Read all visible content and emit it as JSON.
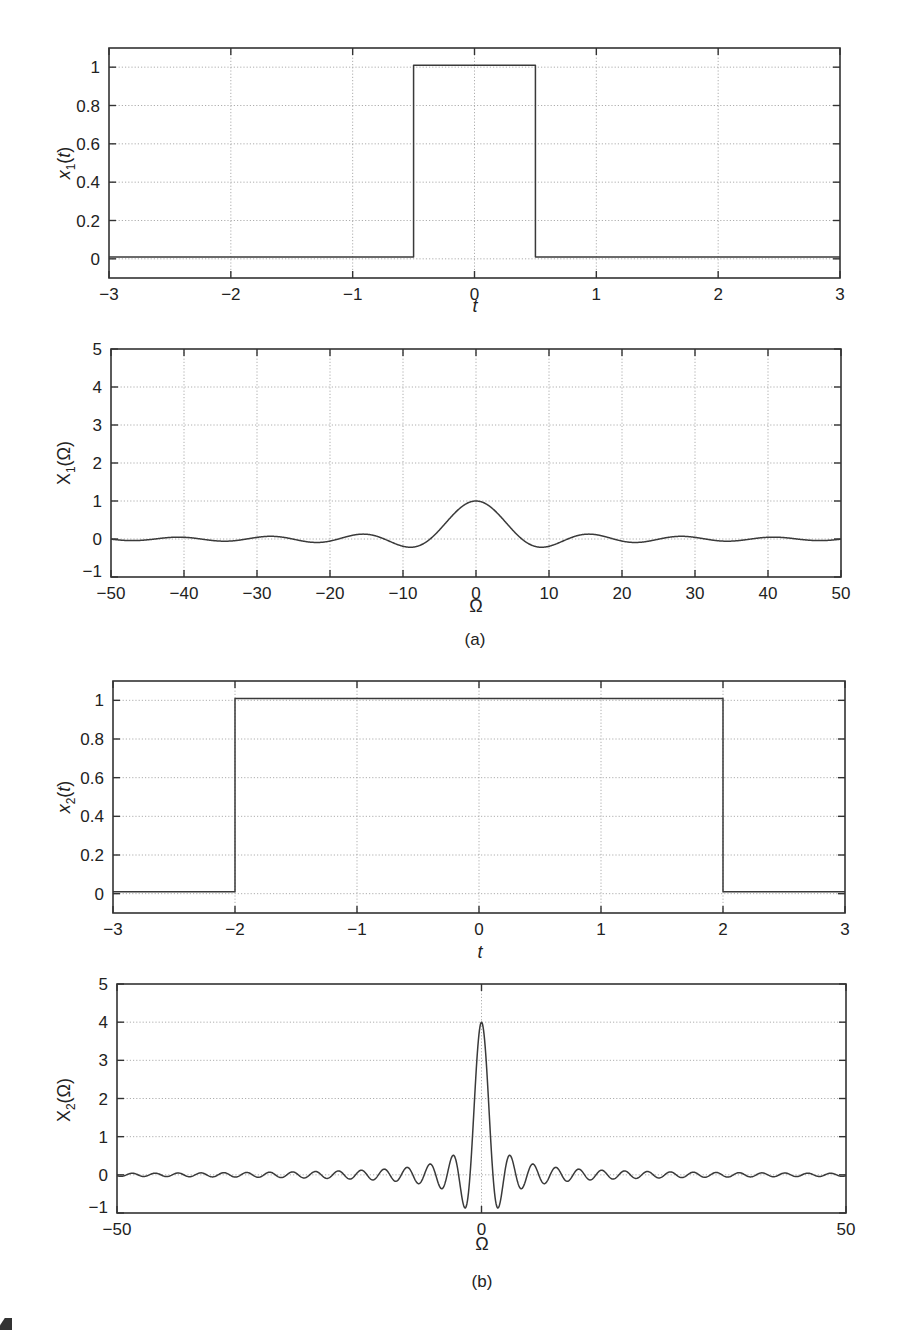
{
  "figure": {
    "captions": [
      "(a)",
      "(b)"
    ],
    "corner_fragment": "1"
  },
  "chart_data": [
    {
      "id": "x1_time",
      "type": "line",
      "title": "",
      "xlabel": "t",
      "ylabel": "x1(t)",
      "ylabel_main": "x",
      "ylabel_sub": "1",
      "ylabel_arg": "(t)",
      "xlim": [
        -3,
        3
      ],
      "ylim": [
        -0.1,
        1.1
      ],
      "xticks": [
        -3,
        -2,
        -1,
        0,
        1,
        2,
        3
      ],
      "xtick_labels": [
        "−3",
        "−2",
        "−1",
        "0",
        "1",
        "2",
        "3"
      ],
      "yticks": [
        0,
        0.2,
        0.4,
        0.6,
        0.8,
        1
      ],
      "ytick_labels": [
        "0",
        "0.2",
        "0.4",
        "0.6",
        "0.8",
        "1"
      ],
      "grid": true,
      "vgrid": [
        -2,
        -1,
        0,
        1,
        2
      ],
      "hgrid": [
        0,
        0.2,
        0.4,
        0.6,
        0.8,
        1
      ],
      "frame": {
        "left": 109,
        "right": 840,
        "top": 48,
        "bottom": 278
      },
      "x": [
        -3,
        -0.5,
        -0.5,
        0.5,
        0.5,
        3
      ],
      "y": [
        0,
        0,
        1,
        1,
        0,
        0
      ],
      "xlabel_pos": {
        "x": 475,
        "y": 312
      },
      "ylabel_pos": {
        "x": 70,
        "y": 163
      }
    },
    {
      "id": "X1_freq",
      "type": "line",
      "title": "",
      "xlabel": "Ω",
      "ylabel": "X1(Ω)",
      "ylabel_main": "X",
      "ylabel_sub": "1",
      "ylabel_arg": "(Ω)",
      "xlim": [
        -50,
        50
      ],
      "ylim": [
        -1,
        5
      ],
      "xticks": [
        -50,
        -40,
        -30,
        -20,
        -10,
        0,
        10,
        20,
        30,
        40,
        50
      ],
      "xtick_labels": [
        "−50",
        "−40",
        "−30",
        "−20",
        "−10",
        "0",
        "10",
        "20",
        "30",
        "40",
        "50"
      ],
      "yticks": [
        -1,
        0,
        1,
        2,
        3,
        4,
        5
      ],
      "ytick_labels": [
        "−1",
        "0",
        "1",
        "2",
        "3",
        "4",
        "5"
      ],
      "grid": true,
      "vgrid": [
        -40,
        -30,
        -20,
        -10,
        0,
        10,
        20,
        30,
        40
      ],
      "hgrid": [
        0,
        1,
        2,
        3,
        4
      ],
      "frame": {
        "left": 111,
        "right": 841,
        "top": 349,
        "bottom": 577
      },
      "function": "sinc_width1",
      "description": "X1(Ω) = sin(Ω/2)/(Ω/2): peak 1 at Ω=0, first minima ≈ −0.22 near Ω=±9, side lobes ≈ +0.13 near ±15",
      "x": [
        -50,
        -45,
        -40,
        -35,
        -30,
        -25,
        -20,
        -15,
        -12,
        -9,
        -6,
        -3,
        0,
        3,
        6,
        9,
        12,
        15,
        20,
        25,
        30,
        35,
        40,
        45,
        50
      ],
      "y": [
        -0.03,
        -0.02,
        0.05,
        -0.04,
        0.06,
        -0.03,
        -0.03,
        0.13,
        0.02,
        -0.22,
        0.05,
        0.66,
        1.0,
        0.66,
        0.05,
        -0.22,
        0.02,
        0.13,
        -0.03,
        -0.03,
        0.06,
        -0.04,
        0.05,
        -0.02,
        -0.03
      ],
      "xlabel_pos": {
        "x": 476,
        "y": 612
      },
      "ylabel_pos": {
        "x": 70,
        "y": 463
      }
    },
    {
      "id": "x2_time",
      "type": "line",
      "title": "",
      "xlabel": "t",
      "ylabel": "x2(t)",
      "ylabel_main": "x",
      "ylabel_sub": "2",
      "ylabel_arg": "(t)",
      "xlim": [
        -3,
        3
      ],
      "ylim": [
        -0.1,
        1.1
      ],
      "xticks": [
        -3,
        -2,
        -1,
        0,
        1,
        2,
        3
      ],
      "xtick_labels": [
        "−3",
        "−2",
        "−1",
        "0",
        "1",
        "2",
        "3"
      ],
      "yticks": [
        0,
        0.2,
        0.4,
        0.6,
        0.8,
        1
      ],
      "ytick_labels": [
        "0",
        "0.2",
        "0.4",
        "0.6",
        "0.8",
        "1"
      ],
      "grid": true,
      "vgrid": [
        -2,
        -1,
        0,
        1,
        2
      ],
      "hgrid": [
        0,
        0.2,
        0.4,
        0.6,
        0.8,
        1
      ],
      "frame": {
        "left": 113,
        "right": 845,
        "top": 681,
        "bottom": 913
      },
      "x": [
        -3,
        -2,
        -2,
        2,
        2,
        3
      ],
      "y": [
        0,
        0,
        1,
        1,
        0,
        0
      ],
      "xlabel_pos": {
        "x": 480,
        "y": 958
      },
      "ylabel_pos": {
        "x": 70,
        "y": 797
      }
    },
    {
      "id": "X2_freq",
      "type": "line",
      "title": "",
      "xlabel": "Ω",
      "ylabel": "X2(Ω)",
      "ylabel_main": "X",
      "ylabel_sub": "2",
      "ylabel_arg": "(Ω)",
      "xlim": [
        -50,
        50
      ],
      "ylim": [
        -1,
        5
      ],
      "xticks": [
        -50,
        0,
        50
      ],
      "xtick_labels": [
        "−50",
        "0",
        "50"
      ],
      "yticks": [
        -1,
        0,
        1,
        2,
        3,
        4,
        5
      ],
      "ytick_labels": [
        "−1",
        "0",
        "1",
        "2",
        "3",
        "4",
        "5"
      ],
      "grid": true,
      "vgrid": [
        0
      ],
      "hgrid": [
        0,
        1,
        2,
        3,
        4
      ],
      "frame": {
        "left": 117,
        "right": 846,
        "top": 984,
        "bottom": 1213
      },
      "function": "sinc_width4",
      "description": "X2(Ω) = 4·sin(2Ω)/(2Ω): peak 4 at Ω=0, first minima ≈ −0.87 near Ω=±2.25, ripples decaying to ~±0.05 at Ω=±50",
      "x": [
        -50,
        -20,
        -10,
        -5.5,
        -3.9,
        -2.25,
        0,
        2.25,
        3.9,
        5.5,
        10,
        20,
        50
      ],
      "y": [
        0.05,
        0.1,
        0.2,
        -0.4,
        0.55,
        -0.87,
        4.0,
        -0.87,
        0.55,
        -0.4,
        0.2,
        0.1,
        0.05
      ],
      "xlabel_pos": {
        "x": 482,
        "y": 1250
      },
      "ylabel_pos": {
        "x": 70,
        "y": 1100
      }
    }
  ]
}
